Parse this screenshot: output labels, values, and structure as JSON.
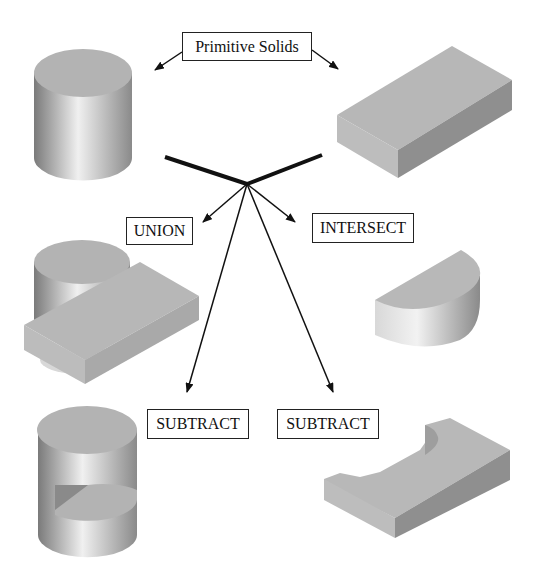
{
  "diagram": {
    "title_label": "Primitive Solids",
    "operations": [
      {
        "label": "UNION",
        "result": "cylinder fused with block"
      },
      {
        "label": "INTERSECT",
        "result": "half-cylinder segment"
      },
      {
        "label": "SUBTRACT",
        "result": "cylinder with block-shaped notch removed"
      },
      {
        "label": "SUBTRACT",
        "result": "block with cylindrical cutout"
      }
    ],
    "primitives": [
      "cylinder",
      "box"
    ],
    "colors": {
      "face_top": "#b4b4b4",
      "face_dark": "#8e8e8e",
      "line": "#111111"
    }
  }
}
